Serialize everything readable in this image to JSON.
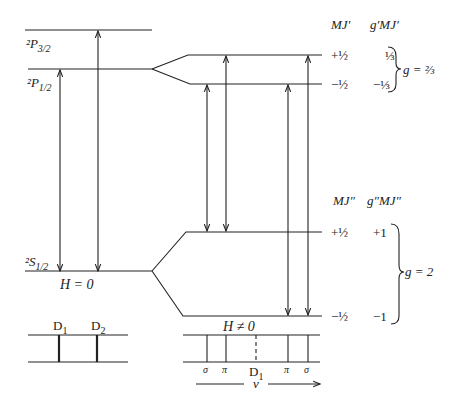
{
  "levels": {
    "p32": {
      "label": "²P",
      "sub": "3/2"
    },
    "p12": {
      "label": "²P",
      "sub": "1/2"
    },
    "s12": {
      "label": "²S",
      "sub": "1/2"
    }
  },
  "field_labels": {
    "zero": "H = 0",
    "nonzero": "H ≠ 0"
  },
  "upper_table": {
    "header_mj": "MJ′",
    "header_gmj": "g′MJ′",
    "rows": [
      {
        "mj": "+½",
        "gmj": "⅓"
      },
      {
        "mj": "−½",
        "gmj": "−⅓"
      }
    ],
    "g_label": "g = ⅔"
  },
  "lower_table": {
    "header_mj": "MJ″",
    "header_gmj": "g″MJ″",
    "rows": [
      {
        "mj": "+½",
        "gmj": "+1"
      },
      {
        "mj": "−½",
        "gmj": "−1"
      }
    ],
    "g_label": "g = 2"
  },
  "spectrum_zero": {
    "lines": [
      "D1",
      "D2"
    ]
  },
  "spectrum_nonzero": {
    "components": [
      "σ",
      "π",
      "D1",
      "π",
      "σ"
    ],
    "center_label": "D1",
    "axis_label": "ν"
  },
  "colors": {
    "line": "#222222",
    "background": "#ffffff"
  }
}
